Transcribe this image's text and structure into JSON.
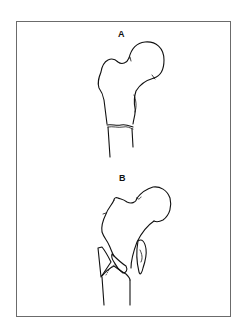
{
  "figure": {
    "panels": [
      {
        "id": "A",
        "label": "A",
        "description": "Proximal femur with transverse subtrochanteric fracture line"
      },
      {
        "id": "B",
        "label": "B",
        "description": "Proximal femur with comminuted intertrochanteric fracture and displaced fragments"
      }
    ]
  }
}
